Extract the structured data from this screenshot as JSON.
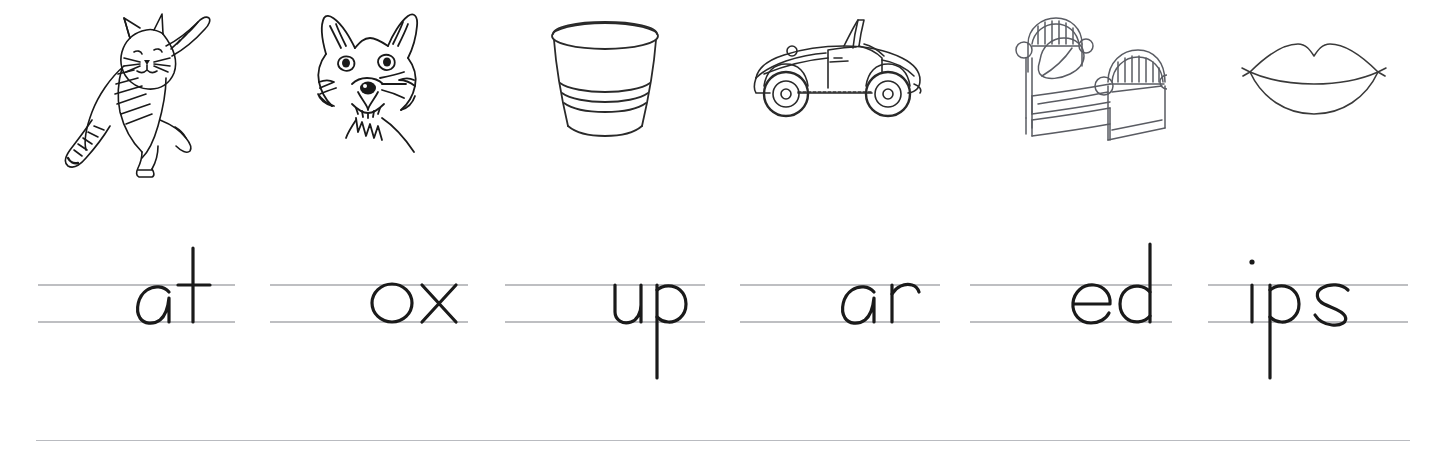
{
  "worksheet": {
    "title": "Phonics word-family picture worksheet",
    "ink_color": "#1a1a1a",
    "rule_color": "#a8aaae",
    "footer_rule_color": "#b9bbc0",
    "background_color": "#ffffff",
    "line_count_per_group": 2
  },
  "items": [
    {
      "id": "cat",
      "picture_name": "cat-illustration",
      "picture_label": "cat",
      "word": "at",
      "full_word": "cat",
      "pic_x": 62,
      "pic_width": 150,
      "line_x": 38,
      "line_width": 197
    },
    {
      "id": "fox",
      "picture_name": "fox-illustration",
      "picture_label": "fox",
      "word": "ox",
      "full_word": "fox",
      "pic_x": 300,
      "pic_width": 140,
      "line_x": 270,
      "line_width": 198
    },
    {
      "id": "cup",
      "picture_name": "cup-illustration",
      "picture_label": "cup",
      "word": "up",
      "full_word": "cup",
      "pic_x": 538,
      "pic_width": 135,
      "line_x": 505,
      "line_width": 200
    },
    {
      "id": "car",
      "picture_name": "car-illustration",
      "picture_label": "car",
      "word": "ar",
      "full_word": "car",
      "pic_x": 748,
      "pic_width": 178,
      "line_x": 740,
      "line_width": 200
    },
    {
      "id": "bed",
      "picture_name": "bed-illustration",
      "picture_label": "bed",
      "word": "ed",
      "full_word": "bed",
      "pic_x": 1002,
      "pic_width": 165,
      "line_x": 970,
      "line_width": 202
    },
    {
      "id": "lips",
      "picture_name": "lips-illustration",
      "picture_label": "lips",
      "word": "ips",
      "full_word": "lips",
      "pic_x": 1238,
      "pic_width": 152,
      "line_x": 1208,
      "line_width": 200
    }
  ]
}
